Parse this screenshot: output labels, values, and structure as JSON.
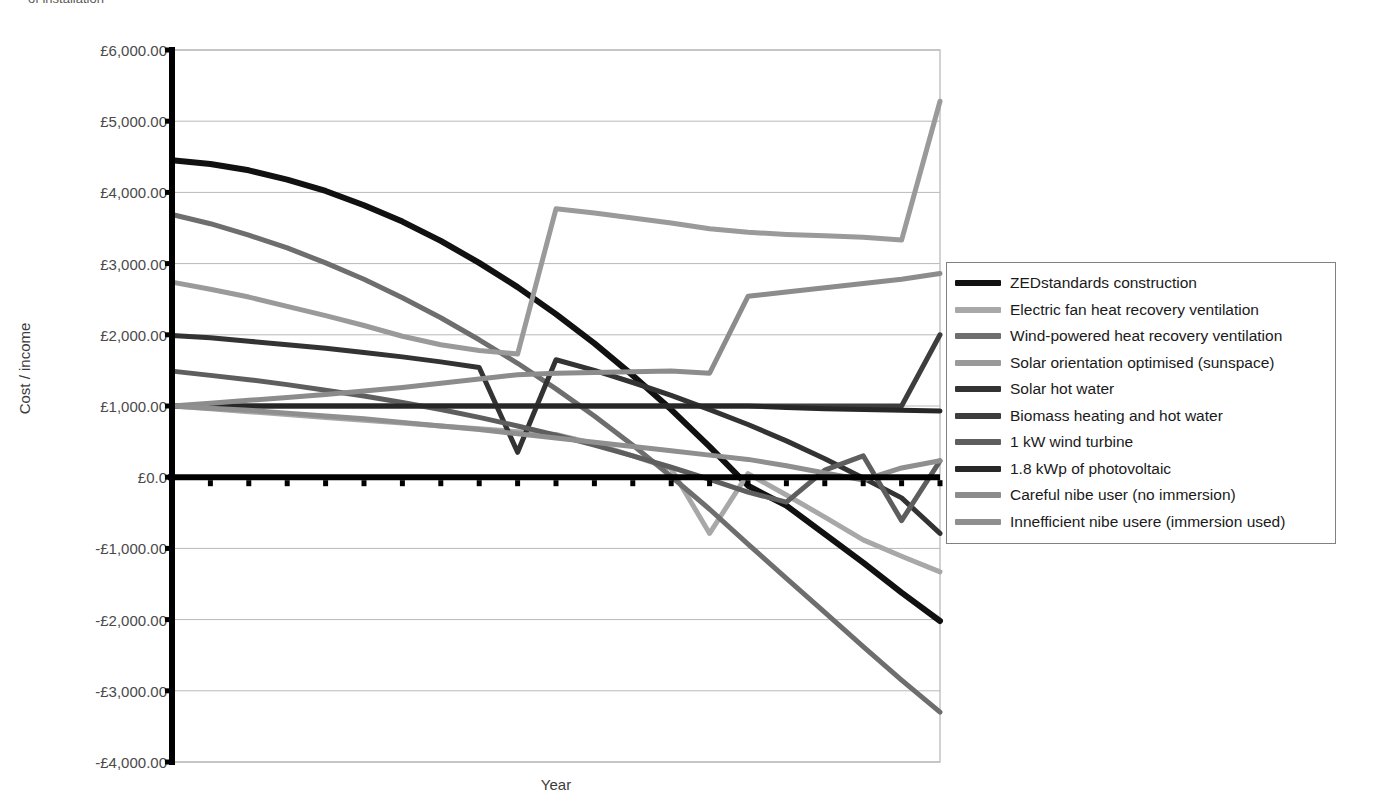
{
  "top_caption": "of installation",
  "axes": {
    "ylabel": "Cost / income",
    "xlabel": "Year",
    "yticks": [
      "£6,000.00",
      "£5,000.00",
      "£4,000.00",
      "£3,000.00",
      "£2,000.00",
      "£1,000.00",
      "£0.0",
      "-£1,000.00",
      "-£2,000.00",
      "-£3,000.00",
      "-£4,000.00"
    ],
    "ytick_values": [
      6000,
      5000,
      4000,
      3000,
      2000,
      1000,
      0,
      -1000,
      -2000,
      -3000,
      -4000
    ]
  },
  "legend": {
    "position": "right",
    "items": [
      {
        "label": "ZEDstandards construction",
        "color": "#111111"
      },
      {
        "label": "Electric fan heat recovery ventilation",
        "color": "#a8a8a8"
      },
      {
        "label": "Wind-powered heat recovery ventilation",
        "color": "#6e6e6e"
      },
      {
        "label": "Solar orientation optimised (sunspace)",
        "color": "#9a9a9a"
      },
      {
        "label": "Solar hot water",
        "color": "#333333"
      },
      {
        "label": "Biomass heating and hot water",
        "color": "#3d3d3d"
      },
      {
        "label": "1 kW wind turbine",
        "color": "#5e5e5e"
      },
      {
        "label": "1.8 kWp of photovoltaic",
        "color": "#272727"
      },
      {
        "label": "Careful nibe user (no immersion)",
        "color": "#8c8c8c"
      },
      {
        "label": "Innefficient nibe usere (immersion used)",
        "color": "#8f8f8f"
      }
    ]
  },
  "chart_data": {
    "type": "line",
    "title": "",
    "xlabel": "Year",
    "ylabel": "Cost / income",
    "grid": true,
    "legend_position": "right",
    "ylim": [
      -4000,
      6000
    ],
    "categories": [
      2005,
      2006,
      2007,
      2008,
      2009,
      2010,
      2011,
      2012,
      2013,
      2014,
      2015,
      2016,
      2017,
      2018,
      2019,
      2020,
      2021,
      2022,
      2023,
      2024,
      2025
    ],
    "series": [
      {
        "name": "ZEDstandards construction",
        "color": "#111111",
        "width": 6,
        "values": [
          4450,
          4400,
          4310,
          4180,
          4020,
          3820,
          3590,
          3320,
          3010,
          2670,
          2290,
          1880,
          1430,
          950,
          430,
          -120,
          -400,
          -800,
          -1200,
          -1620,
          -2020
        ]
      },
      {
        "name": "Electric fan heat recovery ventilation",
        "color": "#a8a8a8",
        "width": 5,
        "values": [
          1000,
          960,
          920,
          880,
          840,
          800,
          760,
          720,
          680,
          640,
          600,
          470,
          300,
          120,
          -790,
          50,
          -250,
          -560,
          -880,
          -1110,
          -1330
        ]
      },
      {
        "name": "Wind-powered heat recovery ventilation",
        "color": "#6e6e6e",
        "width": 5,
        "values": [
          3690,
          3560,
          3400,
          3220,
          3010,
          2780,
          2520,
          2240,
          1930,
          1600,
          1240,
          860,
          450,
          10,
          -450,
          -940,
          -1420,
          -1900,
          -2380,
          -2850,
          -3300
        ]
      },
      {
        "name": "Solar orientation optimised (sunspace)",
        "color": "#9a9a9a",
        "width": 5,
        "values": [
          2740,
          2640,
          2530,
          2400,
          2270,
          2130,
          1980,
          1860,
          1780,
          1730,
          3770,
          3710,
          3640,
          3570,
          3490,
          3440,
          3410,
          3390,
          3370,
          3330,
          5280
        ]
      },
      {
        "name": "Solar hot water",
        "color": "#333333",
        "width": 5,
        "values": [
          1990,
          1960,
          1910,
          1860,
          1810,
          1750,
          1690,
          1620,
          1540,
          350,
          1650,
          1500,
          1330,
          1150,
          950,
          740,
          510,
          260,
          -10,
          -290,
          -790
        ]
      },
      {
        "name": "Biomass heating and hot water",
        "color": "#3d3d3d",
        "width": 5,
        "values": [
          1000,
          1000,
          1000,
          1000,
          1000,
          1000,
          1000,
          1000,
          1000,
          1000,
          1000,
          1000,
          1000,
          1000,
          1000,
          1000,
          1000,
          1000,
          1000,
          1000,
          2000
        ]
      },
      {
        "name": "1 kW wind turbine",
        "color": "#5e5e5e",
        "width": 5,
        "values": [
          1490,
          1430,
          1370,
          1300,
          1220,
          1140,
          1050,
          950,
          840,
          720,
          590,
          450,
          300,
          140,
          -30,
          -210,
          -350,
          100,
          300,
          -610,
          230
        ]
      },
      {
        "name": "1.8 kWp of photovoltaic",
        "color": "#272727",
        "width": 5,
        "values": [
          1000,
          1000,
          1000,
          1000,
          1000,
          1000,
          1000,
          1000,
          1000,
          1000,
          1000,
          1000,
          1000,
          1000,
          1000,
          1000,
          980,
          960,
          950,
          940,
          930
        ]
      },
      {
        "name": "Careful nibe user (no immersion)",
        "color": "#8c8c8c",
        "width": 5,
        "values": [
          1000,
          1040,
          1080,
          1120,
          1160,
          1210,
          1260,
          1320,
          1380,
          1440,
          1460,
          1470,
          1480,
          1490,
          1460,
          2540,
          2600,
          2660,
          2720,
          2780,
          2860
        ]
      },
      {
        "name": "Innefficient nibe usere (immersion used)",
        "color": "#8f8f8f",
        "width": 5,
        "values": [
          1000,
          970,
          940,
          900,
          860,
          820,
          770,
          720,
          670,
          610,
          550,
          490,
          430,
          370,
          310,
          250,
          160,
          60,
          -40,
          130,
          230
        ]
      }
    ]
  }
}
